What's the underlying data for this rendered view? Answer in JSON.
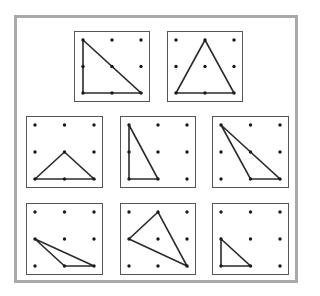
{
  "figure": {
    "grid_size": 3,
    "stroke_color": "#2b2b2b",
    "dot_color": "#1a1a1a",
    "border_color": "#a9a9a9",
    "panels": [
      {
        "id": 1,
        "row": 1,
        "x": 74,
        "y": 31,
        "w": 76,
        "h": 71,
        "triangle": [
          [
            0,
            0
          ],
          [
            0,
            2
          ],
          [
            2,
            2
          ]
        ]
      },
      {
        "id": 2,
        "row": 1,
        "x": 167,
        "y": 31,
        "w": 76,
        "h": 71,
        "triangle": [
          [
            1,
            0
          ],
          [
            0,
            2
          ],
          [
            2,
            2
          ]
        ]
      },
      {
        "id": 3,
        "row": 2,
        "x": 26,
        "y": 116,
        "w": 77,
        "h": 72,
        "triangle": [
          [
            0,
            2
          ],
          [
            1,
            1
          ],
          [
            2,
            2
          ]
        ]
      },
      {
        "id": 4,
        "row": 2,
        "x": 120,
        "y": 116,
        "w": 76,
        "h": 72,
        "triangle": [
          [
            0,
            0
          ],
          [
            0,
            2
          ],
          [
            1,
            2
          ]
        ]
      },
      {
        "id": 5,
        "row": 2,
        "x": 212,
        "y": 116,
        "w": 77,
        "h": 72,
        "triangle": [
          [
            0,
            0
          ],
          [
            1,
            2
          ],
          [
            2,
            2
          ]
        ]
      },
      {
        "id": 6,
        "row": 3,
        "x": 26,
        "y": 203,
        "w": 77,
        "h": 72,
        "triangle": [
          [
            0,
            1
          ],
          [
            1,
            2
          ],
          [
            2,
            2
          ]
        ]
      },
      {
        "id": 7,
        "row": 3,
        "x": 120,
        "y": 203,
        "w": 76,
        "h": 72,
        "triangle": [
          [
            1,
            0
          ],
          [
            0,
            1
          ],
          [
            2,
            2
          ]
        ]
      },
      {
        "id": 8,
        "row": 3,
        "x": 212,
        "y": 203,
        "w": 77,
        "h": 72,
        "triangle": [
          [
            0,
            1
          ],
          [
            0,
            2
          ],
          [
            1,
            2
          ]
        ]
      }
    ]
  }
}
